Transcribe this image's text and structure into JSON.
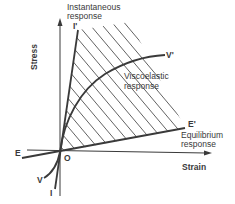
{
  "diagram": {
    "type": "stress-strain response diagram",
    "axes": {
      "y_label": "Stress",
      "x_label": "Strain",
      "origin_label": "O"
    },
    "lines": {
      "instantaneous": {
        "start_label": "I",
        "end_label": "I'",
        "caption_line1": "Instantaneous",
        "caption_line2": "response"
      },
      "viscoelastic": {
        "start_label": "V",
        "end_label": "V'",
        "caption_line1": "Viscoelastic",
        "caption_line2": "response"
      },
      "equilibrium": {
        "start_label": "E",
        "end_label": "E'",
        "caption_line1": "Equilibrium",
        "caption_line2": "response"
      }
    },
    "colors": {
      "line": "#3a3a3a",
      "text": "#3a3a3a",
      "background": "#ffffff"
    }
  }
}
